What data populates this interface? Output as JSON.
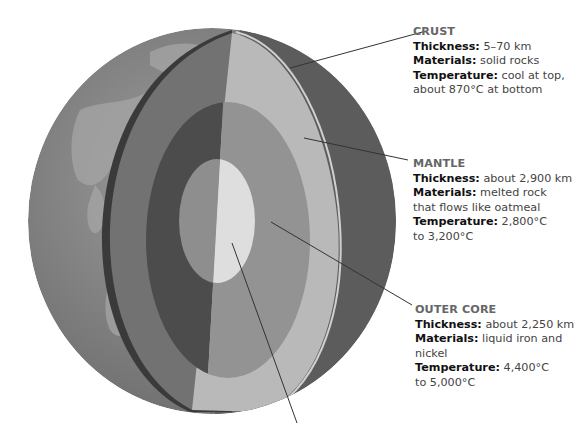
{
  "diagram": {
    "colors": {
      "surface": "#8a8a8a",
      "crust_edge": "#3a3a3a",
      "mantle_shadow": "#6e6e6e",
      "mantle_lit": "#b8b8b8",
      "outer_core_shadow": "#4a4a4a",
      "outer_core_lit": "#959595",
      "inner_core_shadow": "#8c8c8c",
      "inner_core_lit": "#dedede",
      "leader_line": "#333333"
    }
  },
  "labels": {
    "crust": {
      "title": "CRUST",
      "thickness_key": "Thickness:",
      "thickness_value": " 5–70 km",
      "materials_key": "Materials:",
      "materials_value": " solid rocks",
      "temperature_key": "Temperature:",
      "temperature_value_1": " cool at top,",
      "temperature_value_2": "about 870°C at bottom"
    },
    "mantle": {
      "title": "MANTLE",
      "thickness_key": "Thickness:",
      "thickness_value": " about 2,900 km",
      "materials_key": "Materials:",
      "materials_value_1": " melted rock",
      "materials_value_2": "that flows like oatmeal",
      "temperature_key": "Temperature:",
      "temperature_value_1": " 2,800°C",
      "temperature_value_2": "to 3,200°C"
    },
    "outer_core": {
      "title": "OUTER CORE",
      "thickness_key": "Thickness:",
      "thickness_value": " about 2,250 km",
      "materials_key": "Materials:",
      "materials_value_1": " liquid iron and",
      "materials_value_2": "nickel",
      "temperature_key": "Temperature:",
      "temperature_value_1": " 4,400°C",
      "temperature_value_2": "to 5,000°C"
    }
  }
}
